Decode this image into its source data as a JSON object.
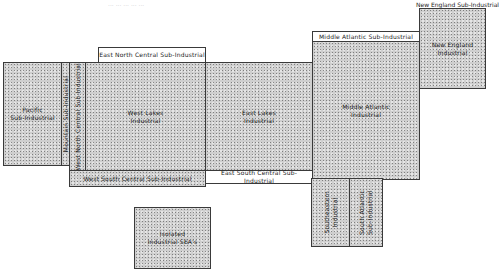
{
  "diagram": {
    "title_fragment": "... ... ... ... ...",
    "regions": {
      "pacific": "Pacific\nSub-Industrial",
      "mountain": "Mountain Sub-Industrial",
      "west_north_central": "West North Central Sub-Industrial",
      "east_north_central": "East North Central Sub-Industrial",
      "west_lakes": "West Lakes\nIndustrial",
      "west_south_central": "West South Central Sub-Industrial",
      "east_lakes": "East Lakes\nIndustrial",
      "east_south_central": "East South Central Sub-Industrial",
      "middle_atlantic_sub": "Middle Atlantic Sub-Industrial",
      "middle_atlantic": "Middle Atlantic\nIndustrial",
      "new_england_sub": "New England Sub-Industrial",
      "new_england": "New England\nIndustrial",
      "southeastern": "Southeastern\nIndustrial",
      "south_atlantic_sub": "South Atlantic\nSub-Industrial",
      "isolated": "Isolated\nIndustrial SEA's"
    },
    "colors": {
      "fill": "#cfcfcf",
      "border": "#3a3a3a",
      "text": "#1a1a1a",
      "background": "#ffffff"
    }
  }
}
